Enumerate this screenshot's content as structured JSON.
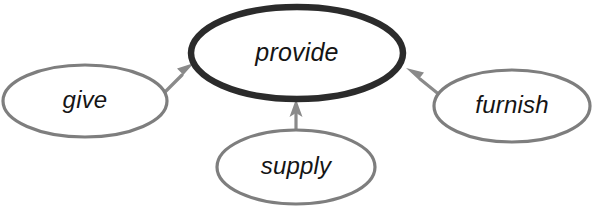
{
  "diagram": {
    "type": "synonym-network",
    "background_color": "#ffffff",
    "width": 604,
    "height": 212,
    "central_node": {
      "id": "provide",
      "label": "provide",
      "shape": "ellipse",
      "cx": 297,
      "cy": 53,
      "rx": 106,
      "ry": 46,
      "stroke_color": "#2b2b2b",
      "stroke_width": 6.5,
      "fill_color": "#ffffff",
      "emphasis": "bold"
    },
    "satellite_nodes": [
      {
        "id": "give",
        "label": "give",
        "shape": "ellipse",
        "cx": 85,
        "cy": 101,
        "rx": 82,
        "ry": 36,
        "stroke_color": "#7e7e7e",
        "stroke_width": 3.2,
        "fill_color": "#ffffff"
      },
      {
        "id": "supply",
        "label": "supply",
        "shape": "ellipse",
        "cx": 296,
        "cy": 167,
        "rx": 79,
        "ry": 37,
        "stroke_color": "#7e7e7e",
        "stroke_width": 3.2,
        "fill_color": "#ffffff"
      },
      {
        "id": "furnish",
        "label": "furnish",
        "shape": "ellipse",
        "cx": 512,
        "cy": 106,
        "rx": 78,
        "ry": 36,
        "stroke_color": "#7e7e7e",
        "stroke_width": 3.2,
        "fill_color": "#ffffff"
      }
    ],
    "edges": [
      {
        "id": "give-to-provide",
        "from": "give",
        "to": "provide",
        "direction": "up-right",
        "arrow_color": "#8a8a8a",
        "x1": 160,
        "y1": 97,
        "x2": 192,
        "y2": 65
      },
      {
        "id": "supply-to-provide",
        "from": "supply",
        "to": "provide",
        "direction": "up",
        "arrow_color": "#8a8a8a",
        "x1": 296,
        "y1": 131,
        "x2": 296,
        "y2": 101
      },
      {
        "id": "furnish-to-provide",
        "from": "furnish",
        "to": "provide",
        "direction": "up-left",
        "arrow_color": "#8a8a8a",
        "x1": 440,
        "y1": 96,
        "x2": 407,
        "y2": 69
      }
    ]
  }
}
